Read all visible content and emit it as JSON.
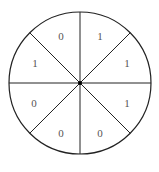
{
  "diagram": {
    "type": "circle-divided-into-8-sectors",
    "center": [
      80,
      83
    ],
    "radius": 71,
    "stroke_color": "#222222",
    "center_dot_color": "#000000",
    "sectors": [
      {
        "position": "top-right",
        "start_deg": 0,
        "end_deg": 45,
        "label": "1"
      },
      {
        "position": "right-upper",
        "start_deg": 45,
        "end_deg": 90,
        "label": "1"
      },
      {
        "position": "right-lower",
        "start_deg": 90,
        "end_deg": 135,
        "label": "1"
      },
      {
        "position": "bottom-right",
        "start_deg": 135,
        "end_deg": 180,
        "label": "0"
      },
      {
        "position": "bottom-left",
        "start_deg": 180,
        "end_deg": 225,
        "label": "0"
      },
      {
        "position": "left-lower",
        "start_deg": 225,
        "end_deg": 270,
        "label": "0"
      },
      {
        "position": "left-upper",
        "start_deg": 270,
        "end_deg": 315,
        "label": "1"
      },
      {
        "position": "top-left",
        "start_deg": 315,
        "end_deg": 360,
        "label": "0"
      }
    ]
  }
}
